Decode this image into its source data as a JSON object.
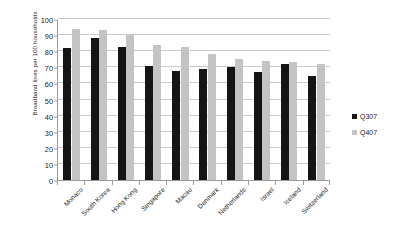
{
  "chart_data": {
    "type": "bar",
    "title": "",
    "subtitle": "",
    "xlabel": "",
    "ylabel": "Broadband lines per 100 households",
    "ylim": [
      0,
      100
    ],
    "ytick_step": 10,
    "yticks": [
      0,
      10,
      20,
      30,
      40,
      50,
      60,
      70,
      80,
      90,
      100
    ],
    "grid": true,
    "legend_position": "right",
    "categories": [
      "Monaco",
      "South Korea",
      "Hong Kong",
      "Singapore",
      "Macau",
      "Denmark",
      "Netherlands",
      "Israel",
      "Iceland",
      "Switzerland"
    ],
    "series": [
      {
        "name": "Q307",
        "color": "#151515",
        "values": [
          82,
          88,
          82.5,
          71,
          68,
          69,
          70.5,
          67,
          72,
          64.5
        ]
      },
      {
        "name": "Q407",
        "color": "#c4c4c4",
        "values": [
          93.5,
          93,
          90,
          84,
          82.5,
          78,
          75,
          74,
          73,
          72
        ]
      }
    ]
  },
  "legend": {
    "items": [
      {
        "label": "Q307",
        "color": "#151515"
      },
      {
        "label": "Q407",
        "color": "#c4c4c4"
      }
    ]
  },
  "colors": {
    "series_a": "#151515",
    "series_b": "#c4c4c4",
    "gridline": "#c9c9c9",
    "axis": "#9a9a9a",
    "background": "#ffffff"
  }
}
